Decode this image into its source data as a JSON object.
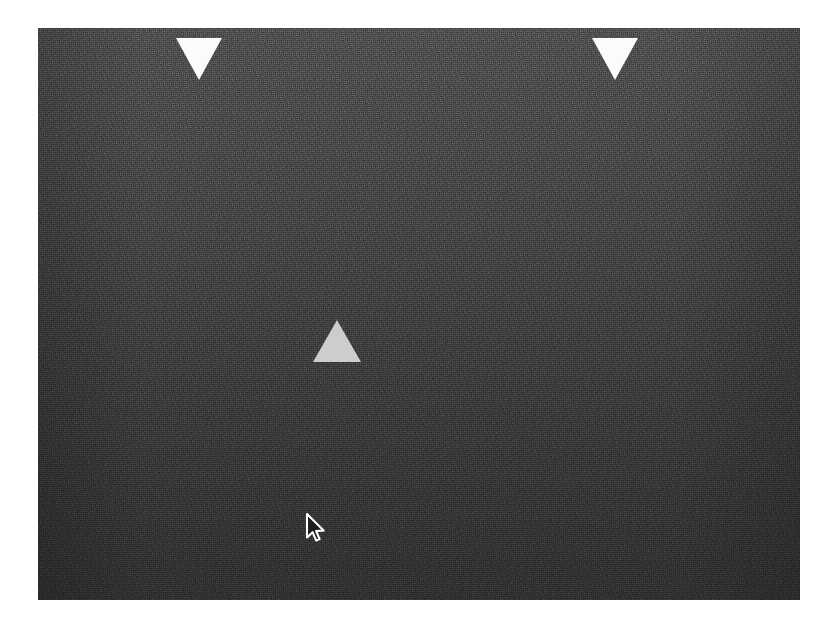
{
  "display": {
    "kind": "psychophysics-stimulus-display",
    "background_color": "#ffffff",
    "field": {
      "x": 38,
      "y": 28,
      "width": 762,
      "height": 572,
      "base_color": "#4a4a4a",
      "gradient_top_color": "#565656",
      "gradient_bottom_color": "#343434",
      "texture": "dense-pixel-noise"
    }
  },
  "stimuli": {
    "reference_triangles": [
      {
        "name": "reference-triangle-left",
        "orientation": "down",
        "fill_color": "#fbfbfb",
        "x": 176,
        "y": 38,
        "width": 46,
        "height": 42
      },
      {
        "name": "reference-triangle-right",
        "orientation": "down",
        "fill_color": "#fbfbfb",
        "x": 592,
        "y": 38,
        "width": 46,
        "height": 42
      }
    ],
    "target_triangle": {
      "name": "target-triangle-center",
      "orientation": "up",
      "fill_color": "#cdcdcd",
      "x": 313,
      "y": 320,
      "width": 48,
      "height": 42
    }
  },
  "cursor": {
    "name": "mouse-pointer",
    "type": "arrow",
    "outline_color": "#ffffff",
    "fill_color": "#1c1c1c",
    "tip_x": 307,
    "tip_y": 514
  }
}
